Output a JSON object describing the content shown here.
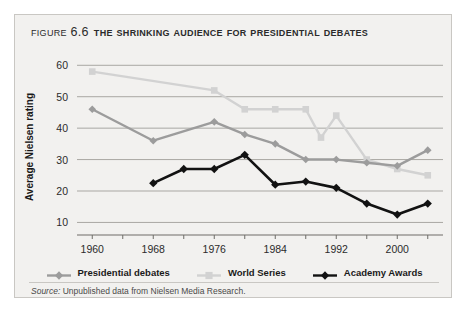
{
  "figure": {
    "number": "Figure 6.6",
    "title": "The Shrinking Audience for Presidential Debates",
    "source_word": "Source:",
    "source_text": " Unpublished data from Nielsen Media Research."
  },
  "colors": {
    "card_background": "#f2f1ef",
    "card_border": "#c9c7c3",
    "gridline": "#a9a7a3",
    "axis": "#6e6c68",
    "presidential_debates": "#9c9c9c",
    "world_series": "#d2d2d2",
    "academy_awards": "#121212",
    "text": "#1a1a1a"
  },
  "chart_data": {
    "type": "line",
    "title": "The Shrinking Audience for Presidential Debates",
    "xlabel": "",
    "ylabel": "Average Nielsen rating",
    "xlim": [
      1958,
      2006
    ],
    "ylim": [
      6,
      62
    ],
    "ytick_values": [
      10,
      20,
      30,
      40,
      50,
      60
    ],
    "ytick_labels": [
      "10",
      "20",
      "30",
      "40",
      "50",
      "60"
    ],
    "xtick_values": [
      1960,
      1964,
      1968,
      1972,
      1976,
      1980,
      1984,
      1988,
      1992,
      1996,
      2000,
      2004
    ],
    "xtick_labeled": [
      1960,
      1968,
      1976,
      1984,
      1992,
      2000
    ],
    "xtick_labels": [
      "1960",
      "1968",
      "1976",
      "1984",
      "1992",
      "2000"
    ],
    "grid": true,
    "legend_position": "bottom",
    "series": [
      {
        "name": "Presidential debates",
        "color": "#9c9c9c",
        "marker": "diamond",
        "x": [
          1960,
          1968,
          1976,
          1980,
          1984,
          1988,
          1992,
          1996,
          2000,
          2004
        ],
        "values": [
          46,
          36,
          42,
          38,
          35,
          30,
          30,
          29,
          28,
          33
        ]
      },
      {
        "name": "World Series",
        "color": "#d2d2d2",
        "marker": "square",
        "x": [
          1960,
          1976,
          1980,
          1984,
          1988,
          1990,
          1992,
          1996,
          2000,
          2004
        ],
        "values": [
          58,
          52,
          46,
          46,
          46,
          37,
          44,
          30,
          27,
          25
        ]
      },
      {
        "name": "Academy Awards",
        "color": "#121212",
        "marker": "diamond",
        "x": [
          1968,
          1972,
          1976,
          1980,
          1984,
          1988,
          1992,
          1996,
          2000,
          2004
        ],
        "values": [
          22.5,
          27,
          27,
          31.5,
          22,
          23,
          21,
          16,
          12.5,
          16
        ]
      }
    ]
  },
  "legend": [
    {
      "label": "Presidential debates",
      "color": "#9c9c9c",
      "marker": "diamond"
    },
    {
      "label": "World Series",
      "color": "#d2d2d2",
      "marker": "square"
    },
    {
      "label": "Academy Awards",
      "color": "#121212",
      "marker": "diamond"
    }
  ]
}
